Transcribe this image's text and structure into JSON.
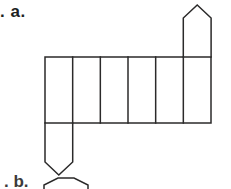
{
  "page": {
    "width": 231,
    "height": 189,
    "background_color": "#ffffff",
    "line_color": "#2b2a2a",
    "face_fill_color": "#ffffff",
    "text_color": "#201f1f"
  },
  "labels": {
    "item_a": ". a.",
    "item_b_partial": ". b."
  },
  "diagram": {
    "name": "hexagonal-prism-net",
    "strip": {
      "cell_count": 6,
      "left": 45,
      "top": 57,
      "right": 211,
      "bottom": 123,
      "cell_width": 27.67,
      "cell_height": 66,
      "divider_x": [
        45,
        72.7,
        100.3,
        128,
        155.7,
        183.3,
        211
      ]
    },
    "hexagons": [
      {
        "name": "top-hexagon",
        "attached_to_cell": 6,
        "orientation": "pointy-side",
        "center_x": 197.2,
        "center_y": 31,
        "radius_x": 26,
        "radius_y": 26,
        "points": "183.3,44 183.3,18 197.2,5 211.1,18 211.1,44 197.2,57"
      },
      {
        "name": "bottom-hexagon",
        "attached_to_cell": 1,
        "orientation": "pointy-side",
        "center_x": 58.8,
        "center_y": 149,
        "radius_x": 26,
        "radius_y": 26,
        "points": "45,136 45,162 58.8,175 72.7,162 72.7,136 58.8,123"
      }
    ],
    "partial_shape_bottom": {
      "name": "cropped-hexagon-b",
      "visible_arc_points": "46,189 50,181 60,177 72,177 82,181 86,189"
    }
  }
}
